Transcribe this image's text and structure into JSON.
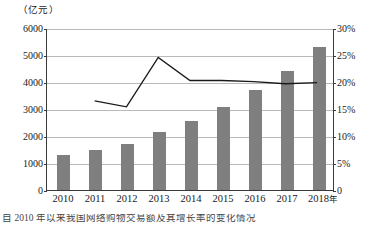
{
  "chart_data": {
    "type": "bar",
    "title": "",
    "subtitle": "",
    "unit_label": "（亿元）",
    "xlabel": "",
    "ylabel": "",
    "categories": [
      "2010",
      "2011",
      "2012",
      "2013",
      "2014",
      "2015",
      "2016",
      "2017",
      "2018"
    ],
    "x_axis_suffix": "年",
    "grid": true,
    "legend_position": "none",
    "series": [
      {
        "name": "金额",
        "type": "bar",
        "axis": "left",
        "unit": "亿元",
        "color": "#7f7f7f",
        "values": [
          1270,
          1480,
          1700,
          2120,
          2540,
          3060,
          3670,
          4380,
          5260
        ]
      },
      {
        "name": "增长率",
        "type": "line",
        "axis": "right",
        "unit": "%",
        "color": "#1a1a1a",
        "values": [
          null,
          16.6,
          15.5,
          24.7,
          20.4,
          20.4,
          20.2,
          19.8,
          20.0
        ]
      }
    ],
    "left_axis": {
      "ticks": [
        "0",
        "1000",
        "2000",
        "3000",
        "4000",
        "5000",
        "6000"
      ],
      "values": [
        0,
        1000,
        2000,
        3000,
        4000,
        5000,
        6000
      ],
      "ylim": [
        0,
        6000
      ]
    },
    "right_axis": {
      "ticks": [
        "0",
        "5%",
        "10%",
        "15%",
        "20%",
        "25%",
        "30%"
      ],
      "values": [
        0,
        5,
        10,
        15,
        20,
        25,
        30
      ],
      "ylim": [
        0,
        30
      ]
    }
  },
  "caption": {
    "text": "自 2010 年以来我国网络购物交易额及其增长率的变化情况"
  }
}
